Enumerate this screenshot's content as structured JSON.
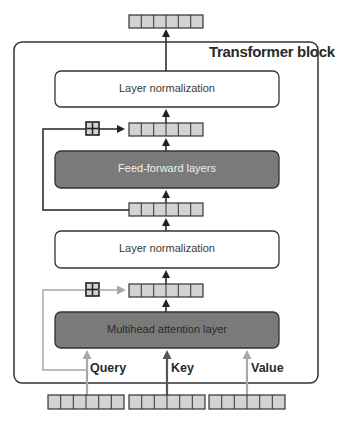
{
  "block_title": "Transformer block",
  "boxes": {
    "ln_top": "Layer normalization",
    "ffn": "Feed-forward layers",
    "ln_bottom": "Layer normalization",
    "mha": "Multihead attention layer"
  },
  "inputs": {
    "query": "Query",
    "key": "Key",
    "value": "Value"
  },
  "colors": {
    "dark_box": "#7a7a7a",
    "vector_cell": "#d3d3d3",
    "border": "#333333",
    "gray_arrow": "#a8a8a8",
    "key_arrow": "#555555"
  },
  "vector_cells": 6
}
